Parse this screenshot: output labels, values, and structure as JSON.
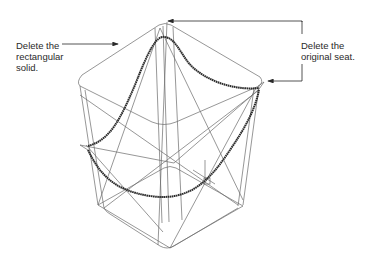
{
  "callouts": [
    {
      "id": "left",
      "lines": [
        "Delete the",
        "rectangular",
        "solid."
      ]
    },
    {
      "id": "right",
      "lines": [
        "Delete the",
        "original seat."
      ]
    }
  ],
  "colors": {
    "wire": "#6a6a6a",
    "seat": "#2b2b2b",
    "text": "#2a2a2a",
    "background": "#ffffff"
  }
}
